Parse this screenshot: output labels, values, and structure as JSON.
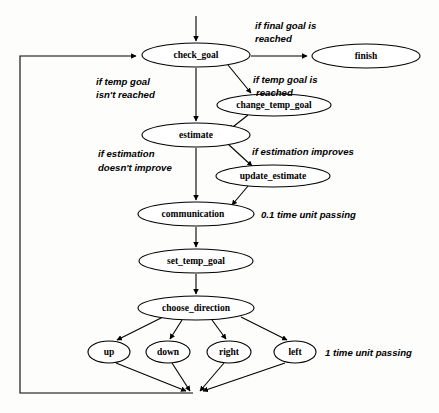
{
  "diagram": {
    "background_color": "#fdfdfc",
    "stroke_color": "#000000",
    "nodes": [
      {
        "id": "check_goal",
        "label": "check_goal",
        "cx": 196,
        "cy": 55,
        "rx": 54,
        "ry": 12
      },
      {
        "id": "finish",
        "label": "finish",
        "cx": 366,
        "cy": 56,
        "rx": 54,
        "ry": 12
      },
      {
        "id": "change_temp_goal",
        "label": "change_temp_goal",
        "cx": 274,
        "cy": 105,
        "rx": 57,
        "ry": 11
      },
      {
        "id": "estimate",
        "label": "estimate",
        "cx": 196,
        "cy": 135,
        "rx": 54,
        "ry": 12
      },
      {
        "id": "update_estimate",
        "label": "update_estimate",
        "cx": 273,
        "cy": 176,
        "rx": 57,
        "ry": 11
      },
      {
        "id": "communication",
        "label": "communication",
        "cx": 196,
        "cy": 214,
        "rx": 58,
        "ry": 12
      },
      {
        "id": "set_temp_goal",
        "label": "set_temp_goal",
        "cx": 196,
        "cy": 261,
        "rx": 57,
        "ry": 12
      },
      {
        "id": "choose_direction",
        "label": "choose_direction",
        "cx": 196,
        "cy": 308,
        "rx": 58,
        "ry": 12
      },
      {
        "id": "up",
        "label": "up",
        "cx": 109,
        "cy": 352,
        "rx": 21,
        "ry": 11
      },
      {
        "id": "down",
        "label": "down",
        "cx": 168,
        "cy": 352,
        "rx": 22,
        "ry": 11
      },
      {
        "id": "right",
        "label": "right",
        "cx": 229,
        "cy": 352,
        "rx": 22,
        "ry": 11
      },
      {
        "id": "left",
        "label": "left",
        "cx": 295,
        "cy": 352,
        "rx": 21,
        "ry": 11
      }
    ],
    "edge_labels": [
      {
        "id": "final-goal-reached",
        "lines": [
          "if final goal is",
          "reached"
        ],
        "x": 255,
        "y": 22
      },
      {
        "id": "temp-goal-not-reached",
        "lines": [
          "if temp goal",
          "isn't reached"
        ],
        "x": 96,
        "y": 77
      },
      {
        "id": "temp-goal-reached",
        "lines": [
          "if temp goal is",
          "reached"
        ],
        "x": 253,
        "y": 75
      },
      {
        "id": "estimation-not-improve",
        "lines": [
          "if estimation",
          "doesn't improve"
        ],
        "x": 98,
        "y": 148
      },
      {
        "id": "estimation-improves",
        "lines": [
          "if estimation improves"
        ],
        "x": 252,
        "y": 148
      },
      {
        "id": "time-unit-0-1",
        "lines": [
          "0.1 time unit passing"
        ],
        "x": 261,
        "y": 209
      },
      {
        "id": "time-unit-1",
        "lines": [
          "1 time unit passing"
        ],
        "x": 325,
        "y": 347
      }
    ],
    "edges": [
      {
        "id": "entry-to-check-goal",
        "from": "entry",
        "to": "check_goal"
      },
      {
        "id": "check-goal-to-finish",
        "from": "check_goal",
        "to": "finish"
      },
      {
        "id": "check-goal-to-change-temp-goal",
        "from": "check_goal",
        "to": "change_temp_goal"
      },
      {
        "id": "check-goal-to-estimate",
        "from": "check_goal",
        "to": "estimate"
      },
      {
        "id": "change-temp-goal-to-estimate",
        "from": "change_temp_goal",
        "to": "estimate"
      },
      {
        "id": "estimate-to-update-estimate",
        "from": "estimate",
        "to": "update_estimate"
      },
      {
        "id": "estimate-to-communication",
        "from": "estimate",
        "to": "communication"
      },
      {
        "id": "update-estimate-to-communication",
        "from": "update_estimate",
        "to": "communication"
      },
      {
        "id": "communication-to-set-temp-goal",
        "from": "communication",
        "to": "set_temp_goal"
      },
      {
        "id": "set-temp-goal-to-choose",
        "from": "set_temp_goal",
        "to": "choose_direction"
      },
      {
        "id": "choose-to-up",
        "from": "choose_direction",
        "to": "up"
      },
      {
        "id": "choose-to-down",
        "from": "choose_direction",
        "to": "down"
      },
      {
        "id": "choose-to-right",
        "from": "choose_direction",
        "to": "right"
      },
      {
        "id": "choose-to-left",
        "from": "choose_direction",
        "to": "left"
      },
      {
        "id": "up-to-join",
        "from": "up",
        "to": "join"
      },
      {
        "id": "down-to-join",
        "from": "down",
        "to": "join"
      },
      {
        "id": "right-to-join",
        "from": "right",
        "to": "join"
      },
      {
        "id": "left-to-join",
        "from": "left",
        "to": "join"
      },
      {
        "id": "join-loopback-to-check-goal",
        "from": "join",
        "to": "check_goal"
      }
    ]
  }
}
